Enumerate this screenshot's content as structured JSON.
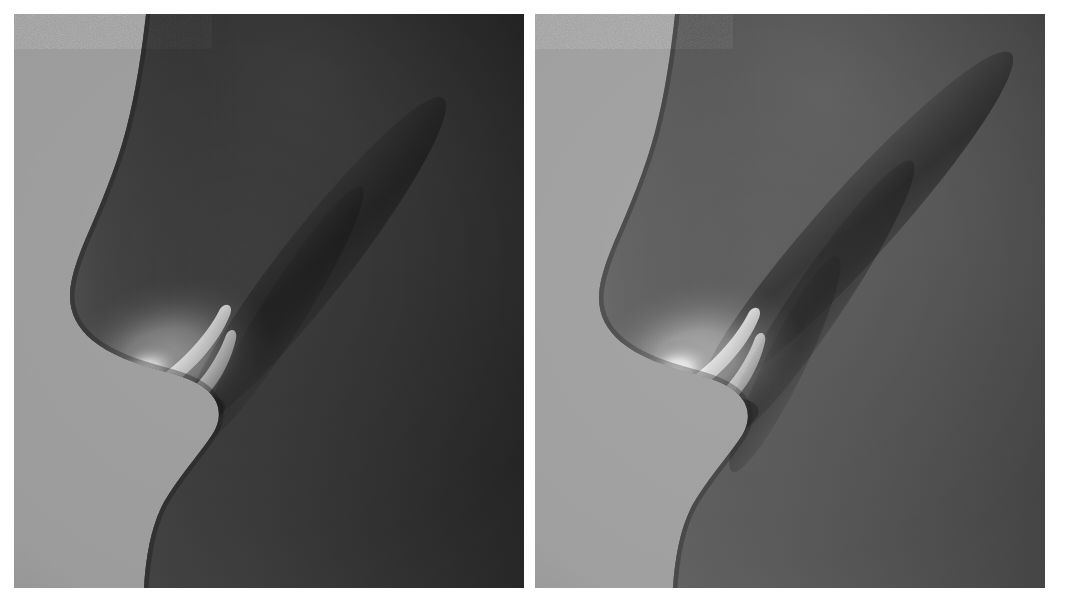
{
  "figure": {
    "kind": "side-by-side-render-comparison",
    "background_color": "#ffffff",
    "panel_count": 2
  },
  "panels": [
    {
      "id": "left",
      "label": "",
      "backdrop_color": "#9c9c9c",
      "skin_dark": "#262626",
      "skin_mid": "#3a3a3a",
      "skin_light": "#585858",
      "highlight_color": "#f2f2f2",
      "overall_exposure": "dark",
      "description": "darker shading, strong falloff into the forehead and cheek"
    },
    {
      "id": "right",
      "label": "",
      "backdrop_color": "#a0a0a0",
      "skin_dark": "#3b3b3b",
      "skin_mid": "#606060",
      "skin_light": "#7a7a7a",
      "highlight_color": "#fafafa",
      "overall_exposure": "light",
      "description": "brighter shading, visible diagonal crease above the nose bridge"
    }
  ],
  "caption": {
    "left_text": "",
    "right_text": ""
  }
}
